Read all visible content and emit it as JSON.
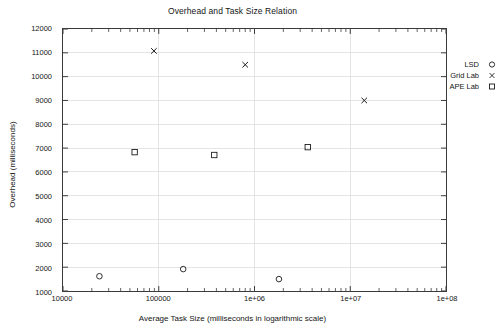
{
  "chart_data": {
    "type": "scatter",
    "title": "Overhead and Task Size Relation",
    "xlabel": "Average Task Size (milliseconds in logarithmic scale)",
    "ylabel": "Overhead (milliseconds)",
    "xscale": "log",
    "yscale": "linear",
    "xlim": [
      10000,
      100000000
    ],
    "ylim": [
      1000,
      12000
    ],
    "grid": true,
    "legend_position": "top-right",
    "xticks": [
      {
        "value": 10000,
        "label": "10000"
      },
      {
        "value": 100000,
        "label": "100000"
      },
      {
        "value": 1000000,
        "label": "1e+06"
      },
      {
        "value": 10000000,
        "label": "1e+07"
      },
      {
        "value": 100000000,
        "label": "1e+08"
      }
    ],
    "yticks": [
      {
        "value": 1000,
        "label": "1000"
      },
      {
        "value": 2000,
        "label": "2000"
      },
      {
        "value": 3000,
        "label": "3000"
      },
      {
        "value": 4000,
        "label": "4000"
      },
      {
        "value": 5000,
        "label": "5000"
      },
      {
        "value": 6000,
        "label": "6000"
      },
      {
        "value": 7000,
        "label": "7000"
      },
      {
        "value": 8000,
        "label": "8000"
      },
      {
        "value": 9000,
        "label": "9000"
      },
      {
        "value": 10000,
        "label": "10000"
      },
      {
        "value": 11000,
        "label": "11000"
      },
      {
        "value": 12000,
        "label": "12000"
      }
    ],
    "series": [
      {
        "name": "LSD",
        "marker": "circle",
        "color": "#1a1a1a",
        "points": [
          {
            "x": 24000,
            "y": 1620
          },
          {
            "x": 180000,
            "y": 1920
          },
          {
            "x": 1800000,
            "y": 1500
          }
        ]
      },
      {
        "name": "Grid Lab",
        "marker": "cross",
        "color": "#1a1a1a",
        "points": [
          {
            "x": 89000,
            "y": 11080
          },
          {
            "x": 800000,
            "y": 10500
          },
          {
            "x": 14000000,
            "y": 9000
          }
        ]
      },
      {
        "name": "APE Lab",
        "marker": "square",
        "color": "#1a1a1a",
        "points": [
          {
            "x": 56000,
            "y": 6830
          },
          {
            "x": 380000,
            "y": 6710
          },
          {
            "x": 3600000,
            "y": 7040
          }
        ]
      }
    ]
  }
}
